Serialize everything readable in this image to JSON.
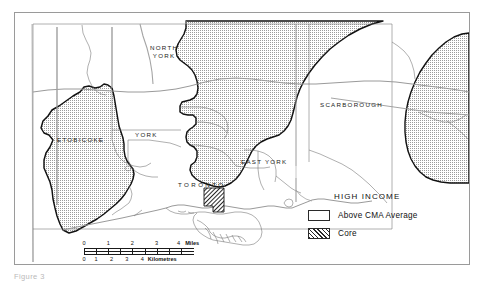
{
  "figure": {
    "caption": "Figure 3"
  },
  "map": {
    "title": "Toronto Census Metropolitan Area — High Income Distribution",
    "places": [
      {
        "name": "north-york",
        "label": "NORTH\nYORK",
        "lines": [
          "NORTH",
          "YORK"
        ],
        "x": 155,
        "y": 48
      },
      {
        "name": "etobicoke",
        "label": "ETOBICOKE",
        "lines": [
          "ETOBICOKE"
        ],
        "x": 60,
        "y": 139
      },
      {
        "name": "york",
        "label": "YORK",
        "lines": [
          "YORK"
        ],
        "x": 138,
        "y": 134
      },
      {
        "name": "east-york",
        "label": "EAST YORK",
        "lines": [
          "EAST YORK"
        ],
        "x": 243,
        "y": 161
      },
      {
        "name": "scarborough",
        "label": "SCARBOROUGH",
        "lines": [
          "SCARBOROUGH"
        ],
        "x": 322,
        "y": 104
      },
      {
        "name": "toronto",
        "label": "TORONTO",
        "lines": [
          "TORONTO"
        ],
        "x": 181,
        "y": 184
      }
    ]
  },
  "legend": {
    "title": "HIGH INCOME",
    "items": [
      {
        "swatch": "dotted-pattern",
        "label": "Above CMA Average"
      },
      {
        "swatch": "diagonal-hatch",
        "label": "Core"
      }
    ]
  },
  "scalebar": {
    "miles": {
      "ticks": [
        "0",
        "1",
        "2",
        "3",
        "4"
      ],
      "unit": "Miles"
    },
    "kilometres": {
      "ticks": [
        "0",
        "1",
        "2",
        "3",
        "4"
      ],
      "unit": "Kilometres"
    }
  },
  "colors": {
    "frame": "#9a9a9a",
    "boundary_thin": "#6e6e6e",
    "boundary_bold": "#111111",
    "fill_above_average": "#e9e9e9",
    "paper": "#ffffff",
    "caption": "#b9b9b9"
  }
}
